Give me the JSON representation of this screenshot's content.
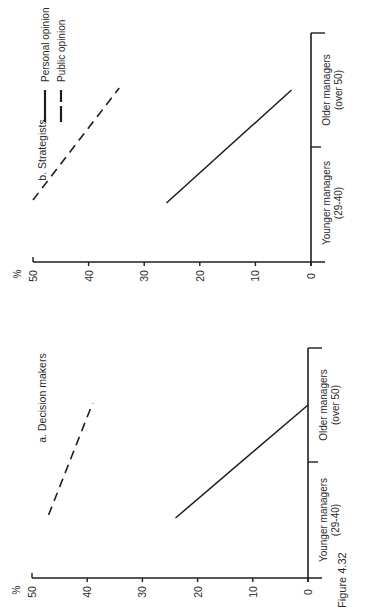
{
  "figure_label": "Figure 4.32",
  "chart_data": [
    {
      "type": "line",
      "title": "a. Decision makers",
      "categories": [
        "Younger managers\n(29-40)",
        "Older managers\n(over 50)"
      ],
      "category_lines": [
        [
          "Younger managers",
          "(29-40)"
        ],
        [
          "Older managers",
          "(over 50)"
        ]
      ],
      "series": [
        {
          "name": "Personal opinion",
          "style": "solid",
          "values": [
            24,
            0
          ]
        },
        {
          "name": "Public opinion",
          "style": "dashed",
          "values": [
            47,
            39
          ]
        }
      ],
      "xlabel": "",
      "ylabel": "%",
      "ylim": [
        0,
        50
      ],
      "yticks": [
        0,
        10,
        20,
        30,
        40,
        50
      ],
      "grid": false,
      "orientation": "rotated 90° counter-clockwise"
    },
    {
      "type": "line",
      "title": "b. Strategists",
      "categories": [
        "Younger managers\n(29-40)",
        "Older managers\n(over 50)"
      ],
      "category_lines": [
        [
          "Younger managers",
          "(29-40)"
        ],
        [
          "Older managers",
          "(over 50)"
        ]
      ],
      "series": [
        {
          "name": "Personal opinion",
          "style": "solid",
          "values": [
            26,
            3.5
          ]
        },
        {
          "name": "Public opinion",
          "style": "dashed",
          "values": [
            50,
            34.5
          ]
        }
      ],
      "xlabel": "",
      "ylabel": "%",
      "ylim": [
        0,
        50
      ],
      "yticks": [
        0,
        10,
        20,
        30,
        40,
        50
      ],
      "grid": false,
      "legend": {
        "position": "top-right",
        "entries": [
          {
            "label": "Personal opinion",
            "style": "solid"
          },
          {
            "label": "Public opinion",
            "style": "dashed"
          }
        ]
      },
      "orientation": "rotated 90° counter-clockwise"
    }
  ],
  "colors": {
    "ink": "#1e1e1e",
    "background": "#ffffff"
  }
}
